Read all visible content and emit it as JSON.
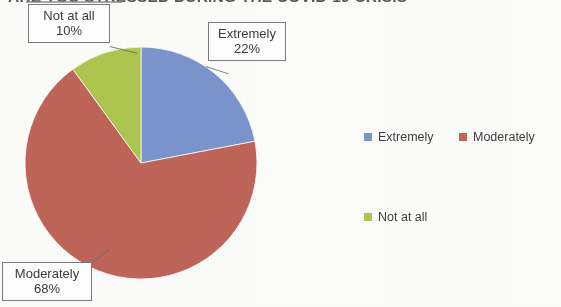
{
  "chart_data": {
    "type": "pie",
    "title": "ARE YOU STRESSED DURING THE COVID-19 CRISIS",
    "categories": [
      "Extremely",
      "Moderately",
      "Not at all"
    ],
    "values": [
      22,
      68,
      10
    ],
    "value_labels": [
      "22%",
      "68%",
      "10%"
    ],
    "colors": [
      "#7b95ce",
      "#c0655a",
      "#afc64e"
    ],
    "legend_position": "right",
    "start_angle_deg": 0,
    "direction": "clockwise",
    "grid": false,
    "xlabel": "",
    "ylabel": ""
  },
  "title": {
    "text": "ARE YOU STRESSED DURING THE COVID-19 CRISIS"
  },
  "callouts": [
    {
      "id": "notatall",
      "name": "Not at all",
      "value": "10%"
    },
    {
      "id": "extremely",
      "name": "Extremely",
      "value": "22%"
    },
    {
      "id": "moderately",
      "name": "Moderately",
      "value": "68%"
    }
  ],
  "legend": {
    "items": [
      {
        "label": "Extremely",
        "color": "#7b95ce"
      },
      {
        "label": "Moderately",
        "color": "#c0655a"
      },
      {
        "label": "Not at all",
        "color": "#afc64e"
      }
    ]
  }
}
